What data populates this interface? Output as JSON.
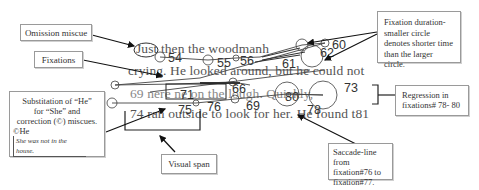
{
  "callouts": {
    "omission": {
      "label": "Omission miscue"
    },
    "fixations": {
      "label": "Fixations"
    },
    "substitution": {
      "line1": "Substitation of “He”",
      "line2": "for “She” and",
      "line3": "correction (©) miscues.",
      "line4": "©He",
      "example": "She was not in the house."
    },
    "visual_span": {
      "label": "Visual span"
    },
    "saccade": {
      "line1": "Saccade-line from",
      "line2": "fixation#76 to",
      "line3": "fixation#77."
    },
    "regression": {
      "line1": "Regression in",
      "line2": "fixations# 78- 80"
    },
    "duration": {
      "line1": "Fixation duration-",
      "line2": "smaller circle",
      "line3": "denotes shorter time",
      "line4": "than the larger circle."
    }
  },
  "reading_text": {
    "line1_word1": "Just",
    "line1_rest": " then the woodmanh",
    "line2": "crying.  He looked around, but he could not",
    "line3": "69 nere           ne on the lough. Quickly,",
    "line4": "74 ran outside to look for her.  He found t81"
  },
  "fixation_numbers": {
    "n54": "54",
    "n55": "55",
    "n56": "56",
    "n59": "59",
    "n60": "60",
    "n62": "62",
    "n61": "61",
    "n64": "64",
    "n66": "66",
    "n69": "69",
    "n71": "71",
    "n73": "73",
    "n75": "75",
    "n76": "76",
    "n78": "78",
    "n80": "80",
    "n81": "81"
  }
}
